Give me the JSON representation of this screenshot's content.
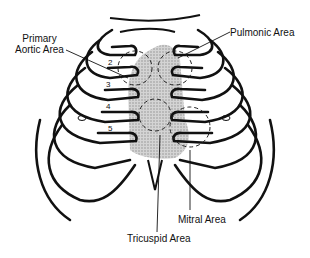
{
  "diagram": {
    "labels": {
      "primary_aortic_line1": "Primary",
      "primary_aortic_line2": "Aortic Area",
      "pulmonic": "Pulmonic Area",
      "mitral": "Mitral Area",
      "tricuspid": "Tricuspid Area"
    },
    "rib_numbers": [
      "2",
      "3",
      "4",
      "5"
    ],
    "colors": {
      "outline": "#111111",
      "heart_shading": "#c8c8c8",
      "background": "#ffffff"
    }
  }
}
